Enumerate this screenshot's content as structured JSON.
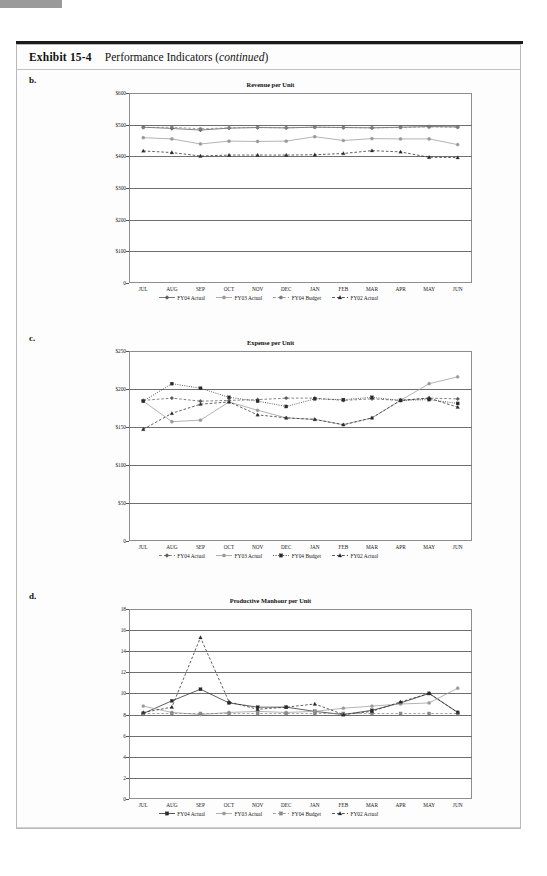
{
  "exhibit": {
    "label": "Exhibit 15-4",
    "title_main": "Performance Indicators (",
    "title_italic": "continued",
    "title_tail": ")"
  },
  "panels": [
    {
      "letter": "b.",
      "chart_data": {
        "type": "line",
        "title": "Revenue per Unit",
        "xlabel": "",
        "ylabel": "",
        "ylim": [
          0,
          600
        ],
        "yticks": [
          0,
          100,
          200,
          300,
          400,
          500,
          600
        ],
        "ytick_labels": [
          "0",
          "$100",
          "$200",
          "$300",
          "$400",
          "$500",
          "$600"
        ],
        "grid": true,
        "legend_position": "bottom",
        "categories": [
          "JUL",
          "AUG",
          "SEP",
          "OCT",
          "NOV",
          "DEC",
          "JAN",
          "FEB",
          "MAR",
          "APR",
          "MAY",
          "JUN"
        ],
        "series": [
          {
            "name": "FY04 Actual",
            "marker": "diamond",
            "dash": "solid",
            "color": "#595959",
            "values": [
              492,
              488,
              483,
              489,
              491,
              490,
              492,
              491,
              490,
              492,
              494,
              493
            ]
          },
          {
            "name": "FY03 Actual",
            "marker": "circle",
            "dash": "solid",
            "color": "#9a9a9a",
            "values": [
              459,
              455,
              439,
              448,
              447,
              448,
              462,
              450,
              456,
              455,
              455,
              437
            ]
          },
          {
            "name": "FY04 Budget",
            "marker": "circle",
            "dash": "dashed",
            "color": "#7d7d7d",
            "values": [
              491,
              492,
              487,
              490,
              491,
              490,
              492,
              491,
              490,
              491,
              493,
              492
            ]
          },
          {
            "name": "FY02 Actual",
            "marker": "triangle",
            "dash": "dashed",
            "color": "#2a2a2a",
            "values": [
              417,
              412,
              401,
              404,
              404,
              404,
              405,
              409,
              418,
              414,
              397,
              396
            ]
          }
        ]
      }
    },
    {
      "letter": "c.",
      "chart_data": {
        "type": "line",
        "title": "Expense per Unit",
        "xlabel": "",
        "ylabel": "",
        "ylim": [
          0,
          250
        ],
        "yticks": [
          0,
          50,
          100,
          150,
          200,
          250
        ],
        "ytick_labels": [
          "0",
          "$50",
          "$100",
          "$150",
          "$200",
          "$250"
        ],
        "grid": true,
        "legend_position": "bottom",
        "categories": [
          "JUL",
          "AUG",
          "SEP",
          "OCT",
          "NOV",
          "DEC",
          "JAN",
          "FEB",
          "MAR",
          "APR",
          "MAY",
          "JUN"
        ],
        "series": [
          {
            "name": "FY04 Actual",
            "marker": "diamond",
            "dash": "dashed",
            "color": "#595959",
            "values": [
              185,
              188,
              184,
              185,
              186,
              188,
              188,
              185,
              187,
              185,
              188,
              187
            ]
          },
          {
            "name": "FY03 Actual",
            "marker": "circle",
            "dash": "solid",
            "color": "#9a9a9a",
            "values": [
              184,
              157,
              159,
              183,
              172,
              162,
              160,
              153,
              162,
              185,
              207,
              216
            ]
          },
          {
            "name": "FY04 Budget",
            "marker": "square",
            "dash": "dotted",
            "color": "#2a2a2a",
            "values": [
              184,
              207,
              201,
              189,
              184,
              177,
              187,
              186,
              189,
              185,
              186,
              181
            ]
          },
          {
            "name": "FY02 Actual",
            "marker": "triangle",
            "dash": "dashed",
            "color": "#2a2a2a",
            "values": [
              147,
              168,
              180,
              183,
              166,
              162,
              160,
              153,
              162,
              185,
              188,
              176
            ]
          }
        ]
      }
    },
    {
      "letter": "d.",
      "chart_data": {
        "type": "line",
        "title": "Productive Manhour per Unit",
        "xlabel": "",
        "ylabel": "",
        "ylim": [
          0,
          18
        ],
        "yticks": [
          0,
          2,
          4,
          6,
          8,
          10,
          12,
          14,
          16,
          18
        ],
        "ytick_labels": [
          "0",
          "2",
          "4",
          "6",
          "8",
          "10",
          "12",
          "14",
          "16",
          "18"
        ],
        "grid": true,
        "legend_position": "bottom",
        "categories": [
          "JUL",
          "AUG",
          "SEP",
          "OCT",
          "NOV",
          "DEC",
          "JAN",
          "FEB",
          "MAR",
          "APR",
          "MAY",
          "JUN"
        ],
        "series": [
          {
            "name": "FY04 Actual",
            "marker": "square",
            "dash": "solid",
            "color": "#2a2a2a",
            "values": [
              8.1,
              9.3,
              10.4,
              9.1,
              8.7,
              8.7,
              8.3,
              8.0,
              8.4,
              9.1,
              10.0,
              8.2
            ]
          },
          {
            "name": "FY03 Actual",
            "marker": "circle",
            "dash": "solid",
            "color": "#9a9a9a",
            "values": [
              8.8,
              8.2,
              8.0,
              8.2,
              8.3,
              8.2,
              8.3,
              8.6,
              8.8,
              9.0,
              9.1,
              10.5
            ]
          },
          {
            "name": "FY04 Budget",
            "marker": "square",
            "dash": "dashed",
            "color": "#8a8a8a",
            "values": [
              8.1,
              8.1,
              8.1,
              8.1,
              8.1,
              8.1,
              8.1,
              8.1,
              8.1,
              8.1,
              8.1,
              8.1
            ]
          },
          {
            "name": "FY02 Actual",
            "marker": "triangle",
            "dash": "dashed",
            "color": "#2a2a2a",
            "values": [
              8.2,
              8.7,
              15.3,
              9.2,
              8.5,
              8.7,
              9.0,
              8.0,
              8.3,
              9.2,
              10.0,
              8.2
            ]
          }
        ]
      }
    }
  ]
}
